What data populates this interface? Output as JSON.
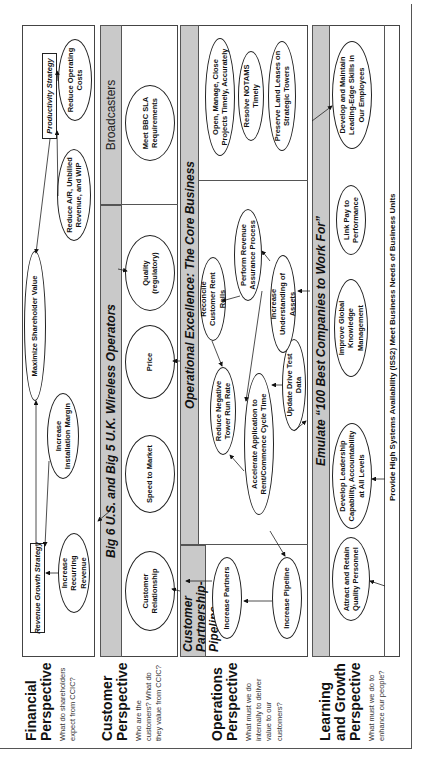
{
  "perspectives": {
    "financial": {
      "title_1": "Financial",
      "title_2": "Perspective",
      "question": "What do shareholders expect from CCIC?"
    },
    "customer": {
      "title_1": "Customer",
      "title_2": "Perspective",
      "question": "Who are the customers? What do they value from CCIC?"
    },
    "operations": {
      "title_1": "Operations",
      "title_2": "Perspective",
      "question": "What must we do internally to deliver value to our customers?"
    },
    "learning": {
      "title_1": "Learning",
      "title_2": "and Growth",
      "title_3": "Perspective",
      "question": "What must we do to enhance our people?"
    }
  },
  "financial": {
    "maximize": "Maximize Shareholder Value",
    "revenue_strategy": "Revenue Growth Strategy",
    "productivity_strategy": "Productivity Strategy",
    "increase_recurring": "Increase Recurring Revenue",
    "increase_installation": "Increase Installation Margin",
    "reduce_ar": "Reduce A/R, Unbilled Revenue, and WIP",
    "reduce_costs": "Reduce Operating Costs"
  },
  "customer": {
    "wireless_header": "Big 6 U.S. and Big 5 U.K. Wireless Operators",
    "broadcasters_header": "Broadcasters",
    "relationship": "Customer Relationship",
    "speed": "Speed to Market",
    "price": "Price",
    "quality": "Quality (regulatory)",
    "bbc": "Meet BBC SLA Requirements"
  },
  "operations": {
    "partnership_header": "Customer Partnership-Pipeline",
    "core_header": "Operational Excellence: The Core Business",
    "increase_partners": "Increase Partners",
    "increase_pipeline": "Increase Pipeline",
    "reduce_tower": "Reduce Negative Tower Run Rate",
    "accelerate": "Accelerate Application to Rent/Commence Cycle Time",
    "update_drive": "Update Drive Test Data",
    "reconcile": "Reconcile Customer Rent Rolls",
    "revenue_assurance": "Perform Revenue Assurance Process",
    "understanding_assets": "Increase Understanding of Assets",
    "open_manage": "Open, Manage, Close Projects Timely, Accurately",
    "notams": "Resolve NOTAMS Timely",
    "land_leases": "Preserve Land Leases on Strategic Towers"
  },
  "learning": {
    "header": "Emulate “100 Best Companies to Work For”",
    "attract": "Attract and Retain Quality Personnel",
    "leadership": "Develop Leadership Capability, Accountability at All Levels",
    "knowledge": "Improve Global Knowledge Management",
    "link_pay": "Link Pay to Performance",
    "skills": "Develop and Maintain Leading-Edge Skills in Our Employees",
    "iss": "Provide High Systems Availability (ISS2) Meet Business Needs of Business Units"
  }
}
